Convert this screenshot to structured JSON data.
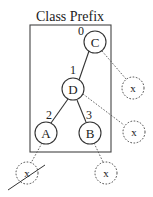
{
  "title": "Class Prefix",
  "nodes": [
    {
      "id": "C",
      "label": "C",
      "index": "0"
    },
    {
      "id": "D",
      "label": "D",
      "index": "1"
    },
    {
      "id": "A",
      "label": "A",
      "index": "2"
    },
    {
      "id": "B",
      "label": "B",
      "index": "3"
    }
  ],
  "ghost_nodes": [
    {
      "label": "x",
      "attached_to": "C",
      "crossed_out": false
    },
    {
      "label": "x",
      "attached_to": "D",
      "crossed_out": false
    },
    {
      "label": "x",
      "attached_to": "A",
      "crossed_out": true
    },
    {
      "label": "x",
      "attached_to": "B",
      "crossed_out": false
    }
  ],
  "colors": {
    "stroke": "#333333",
    "background": "#ffffff"
  }
}
